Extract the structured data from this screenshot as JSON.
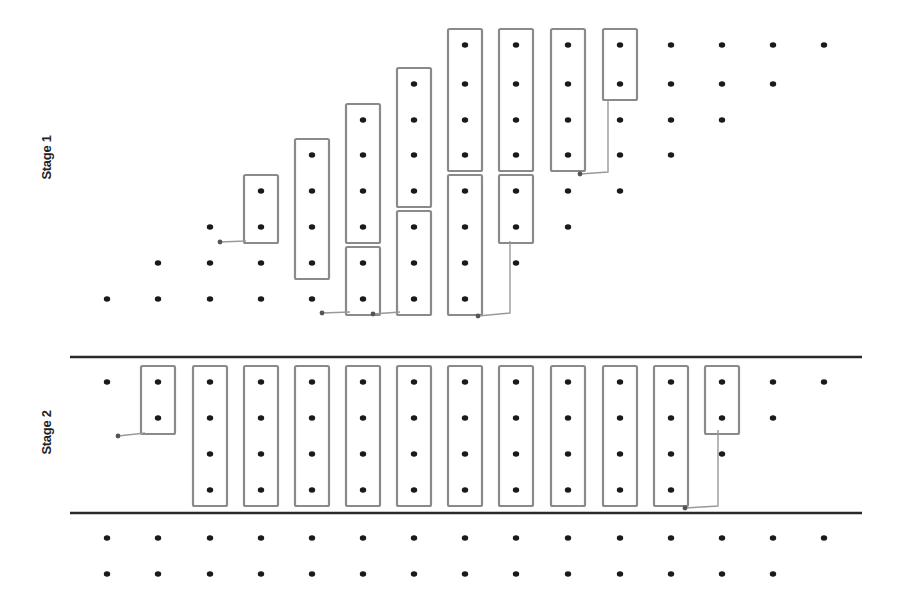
{
  "labels": {
    "stage1": "Stage 1",
    "stage2": "Stage 2"
  },
  "colors": {
    "dot": "#1a1a1a",
    "box": "#8a8a8a",
    "separator": "#2a2a2a",
    "connector": "#9a9a9a"
  },
  "grid": {
    "columns_x": [
      107,
      158,
      210,
      261,
      312,
      363,
      414,
      465,
      516,
      568,
      620,
      671,
      722,
      773,
      824
    ],
    "stage1_rows_y": [
      45,
      84,
      120,
      155,
      191,
      227,
      263,
      299
    ],
    "stage2_rows_y": [
      382,
      418,
      454,
      490
    ],
    "below_rows_y": [
      538,
      574
    ]
  },
  "separators": [
    {
      "y": 357,
      "x1": 70,
      "x2": 862
    },
    {
      "y": 513,
      "x1": 70,
      "x2": 862
    }
  ],
  "stage1": {
    "dots": [
      {
        "col": 0,
        "rows": [
          7
        ]
      },
      {
        "col": 1,
        "rows": [
          6,
          7
        ]
      },
      {
        "col": 2,
        "rows": [
          5,
          6,
          7
        ]
      },
      {
        "col": 3,
        "rows": [
          4,
          5,
          6,
          7
        ]
      },
      {
        "col": 4,
        "rows": [
          3,
          4,
          5,
          6,
          7
        ]
      },
      {
        "col": 5,
        "rows": [
          2,
          3,
          4,
          5,
          6,
          7
        ]
      },
      {
        "col": 6,
        "rows": [
          1,
          2,
          3,
          4,
          5,
          6,
          7
        ]
      },
      {
        "col": 7,
        "rows": [
          0,
          1,
          2,
          3,
          4,
          5,
          6,
          7
        ]
      },
      {
        "col": 8,
        "rows": [
          0,
          1,
          2,
          3,
          4,
          5,
          6
        ]
      },
      {
        "col": 9,
        "rows": [
          0,
          1,
          2,
          3,
          4,
          5
        ]
      },
      {
        "col": 10,
        "rows": [
          0,
          1,
          2,
          3,
          4
        ]
      },
      {
        "col": 11,
        "rows": [
          0,
          1,
          2,
          3
        ]
      },
      {
        "col": 12,
        "rows": [
          0,
          1,
          2
        ]
      },
      {
        "col": 13,
        "rows": [
          0,
          1
        ]
      },
      {
        "col": 14,
        "rows": [
          0
        ]
      }
    ],
    "boxes": [
      {
        "col": 3,
        "row_start": 4,
        "row_end": 5
      },
      {
        "col": 4,
        "row_start": 3,
        "row_end": 6
      },
      {
        "col": 5,
        "row_start": 2,
        "row_end": 5
      },
      {
        "col": 5,
        "row_start": 6,
        "row_end": 7
      },
      {
        "col": 6,
        "row_start": 1,
        "row_end": 4
      },
      {
        "col": 6,
        "row_start": 5,
        "row_end": 7
      },
      {
        "col": 7,
        "row_start": 0,
        "row_end": 3
      },
      {
        "col": 7,
        "row_start": 4,
        "row_end": 7
      },
      {
        "col": 8,
        "row_start": 0,
        "row_end": 3
      },
      {
        "col": 8,
        "row_start": 4,
        "row_end": 5
      },
      {
        "col": 9,
        "row_start": 0,
        "row_end": 3
      },
      {
        "col": 10,
        "row_start": 0,
        "row_end": 1
      }
    ],
    "connectors": [
      {
        "points": [
          [
            246,
            241
          ],
          [
            220,
            242
          ]
        ],
        "end_dot": [
          220,
          242
        ]
      },
      {
        "points": [
          [
            350,
            312
          ],
          [
            322,
            313
          ]
        ],
        "end_dot": [
          322,
          313
        ]
      },
      {
        "points": [
          [
            400,
            312
          ],
          [
            373,
            314
          ]
        ],
        "end_dot": [
          373,
          314
        ]
      },
      {
        "points": [
          [
            510,
            241
          ],
          [
            510,
            313
          ],
          [
            478,
            316
          ]
        ],
        "end_dot": [
          478,
          316
        ]
      },
      {
        "points": [
          [
            608,
            100
          ],
          [
            608,
            172
          ],
          [
            580,
            174
          ]
        ],
        "end_dot": [
          580,
          174
        ]
      }
    ]
  },
  "stage2": {
    "top_dots": [
      0,
      13,
      14
    ],
    "top_dots_row2": [
      13
    ],
    "dots_full_cols": [
      2,
      3,
      4,
      5,
      6,
      7,
      8,
      9,
      10,
      11
    ],
    "extra_dots": [
      {
        "col": 0,
        "rows": [
          0
        ]
      },
      {
        "col": 1,
        "rows": [
          0,
          1
        ]
      },
      {
        "col": 12,
        "rows": [
          0,
          1,
          2
        ]
      },
      {
        "col": 13,
        "rows": [
          0,
          1
        ]
      },
      {
        "col": 14,
        "rows": [
          0
        ]
      }
    ],
    "boxes": [
      {
        "col": 1,
        "row_start": 0,
        "row_end": 1
      },
      {
        "col": 2,
        "row_start": 0,
        "row_end": 3
      },
      {
        "col": 3,
        "row_start": 0,
        "row_end": 3
      },
      {
        "col": 4,
        "row_start": 0,
        "row_end": 3
      },
      {
        "col": 5,
        "row_start": 0,
        "row_end": 3
      },
      {
        "col": 6,
        "row_start": 0,
        "row_end": 3
      },
      {
        "col": 7,
        "row_start": 0,
        "row_end": 3
      },
      {
        "col": 8,
        "row_start": 0,
        "row_end": 3
      },
      {
        "col": 9,
        "row_start": 0,
        "row_end": 3
      },
      {
        "col": 10,
        "row_start": 0,
        "row_end": 3
      },
      {
        "col": 11,
        "row_start": 0,
        "row_end": 3
      },
      {
        "col": 12,
        "row_start": 0,
        "row_end": 1
      }
    ],
    "connectors": [
      {
        "points": [
          [
            145,
            433
          ],
          [
            118,
            436
          ]
        ],
        "end_dot": [
          118,
          436
        ]
      },
      {
        "points": [
          [
            718,
            430
          ],
          [
            718,
            506
          ],
          [
            685,
            508
          ]
        ],
        "end_dot": [
          685,
          508
        ]
      }
    ]
  },
  "below": {
    "row0_cols": [
      0,
      1,
      2,
      3,
      4,
      5,
      6,
      7,
      8,
      9,
      10,
      11,
      12,
      13,
      14
    ],
    "row1_cols": [
      0,
      1,
      2,
      3,
      4,
      5,
      6,
      7,
      8,
      9,
      10,
      11,
      12,
      13
    ]
  }
}
